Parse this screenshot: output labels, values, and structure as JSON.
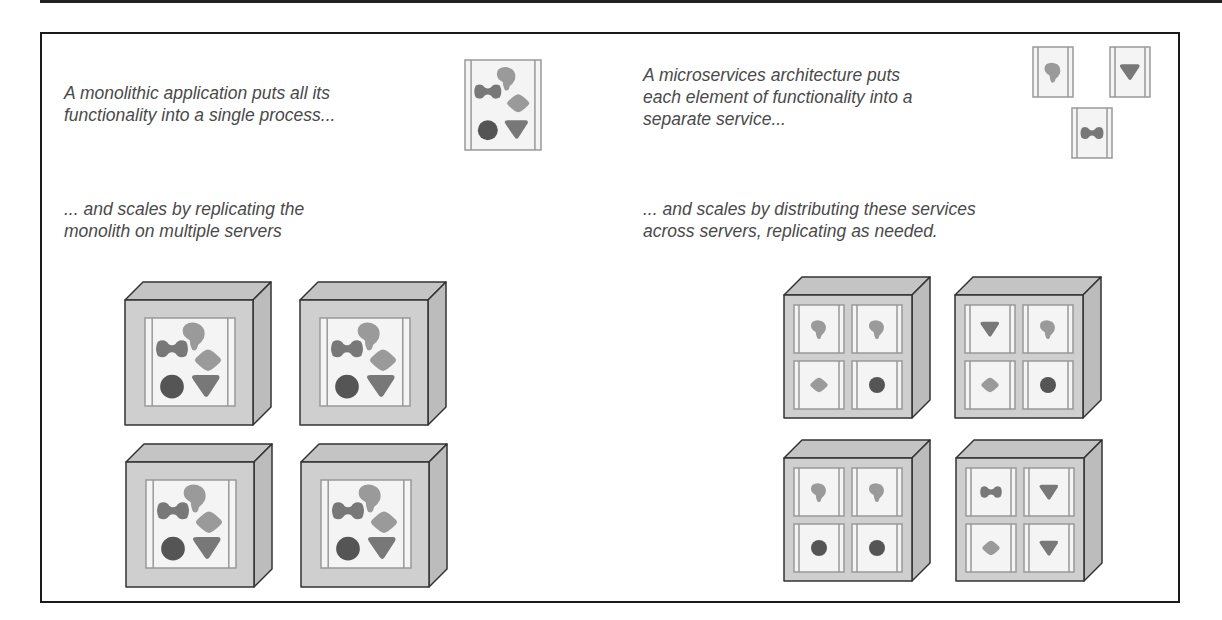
{
  "colors": {
    "frame": "#1a1a1a",
    "text": "#4a4a4a",
    "server_face": "#cfcfcf",
    "server_top": "#c4c4c4",
    "server_side": "#bcbcbc",
    "panel_bg": "#f4f4f4",
    "panel_border": "#999999",
    "shape_dark": "#555555",
    "shape_mid": "#787878",
    "shape_light": "#9a9a9a"
  },
  "left": {
    "intro": "A monolithic application puts all its\nfunctionality into a single process...",
    "scale": "... and scales by replicating the\nmonolith on multiple servers",
    "app_shapes": [
      "bone",
      "blob",
      "diamond",
      "circle",
      "triangle"
    ],
    "servers": [
      {
        "label": "monolith-server-1"
      },
      {
        "label": "monolith-server-2"
      },
      {
        "label": "monolith-server-3"
      },
      {
        "label": "monolith-server-4"
      }
    ]
  },
  "right": {
    "intro": "A microservices architecture puts\neach element of functionality into a\nseparate service...",
    "scale": "... and scales by distributing these services\nacross servers, replicating as needed.",
    "services": [
      "blob",
      "triangle",
      "bone"
    ],
    "servers": [
      {
        "slots": [
          "blob",
          "blob",
          "diamond",
          "circle"
        ]
      },
      {
        "slots": [
          "triangle",
          "blob",
          "diamond",
          "circle"
        ]
      },
      {
        "slots": [
          "blob",
          "blob",
          "circle",
          "circle"
        ]
      },
      {
        "slots": [
          "bone",
          "triangle",
          "diamond",
          "triangle"
        ]
      }
    ]
  }
}
